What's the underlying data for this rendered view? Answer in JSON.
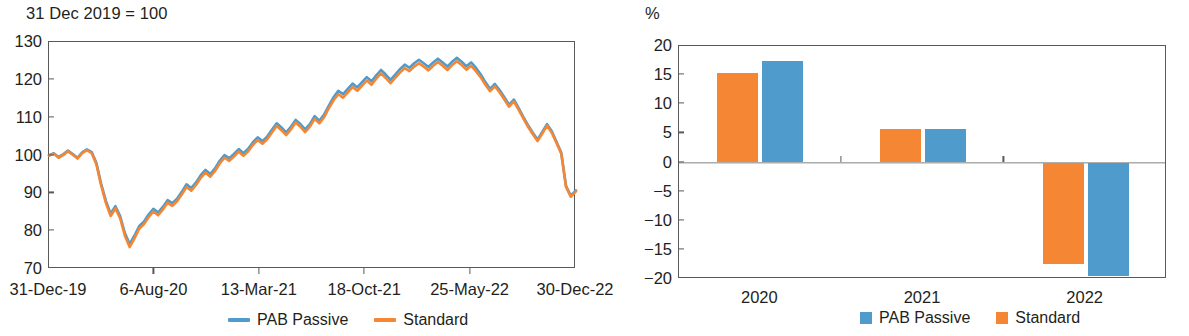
{
  "left": {
    "unit_label": "31 Dec 2019 = 100",
    "legend": [
      {
        "label": "PAB Passive",
        "color": "#4f9bcb",
        "marker": "line"
      },
      {
        "label": "Standard",
        "color": "#f58634",
        "marker": "line"
      }
    ]
  },
  "right": {
    "unit_label": "%",
    "legend": [
      {
        "label": "PAB Passive",
        "color": "#4f9bcb",
        "marker": "box"
      },
      {
        "label": "Standard",
        "color": "#f58634",
        "marker": "box"
      }
    ]
  },
  "chart_data": [
    {
      "type": "line",
      "title": "",
      "xlabel": "",
      "ylabel": "31 Dec 2019 = 100",
      "ylim": [
        70,
        130
      ],
      "yticks": [
        70,
        80,
        90,
        100,
        110,
        120,
        130
      ],
      "xticks": [
        "31-Dec-19",
        "6-Aug-20",
        "13-Mar-21",
        "18-Oct-21",
        "25-May-22",
        "30-Dec-22"
      ],
      "grid": false,
      "legend_position": "bottom",
      "x": [
        0,
        0.9,
        1.8,
        2.7,
        3.6,
        4.5,
        5.4,
        6.3,
        7.2,
        8.1,
        9.0,
        9.9,
        10.8,
        11.7,
        12.6,
        13.5,
        14.4,
        15.3,
        16.2,
        17.1,
        18.0,
        18.9,
        19.8,
        20.7,
        21.6,
        22.5,
        23.4,
        24.3,
        25.2,
        26.1,
        27.0,
        27.9,
        28.8,
        29.7,
        30.6,
        31.5,
        32.4,
        33.3,
        34.2,
        35.1,
        36.0,
        36.9,
        37.8,
        38.7,
        39.6,
        40.5,
        41.4,
        42.3,
        43.2,
        44.1,
        45.0,
        45.9,
        46.8,
        47.7,
        48.6,
        49.5,
        50.4,
        51.3,
        52.2,
        53.1,
        54.0,
        54.9,
        55.8,
        56.7,
        57.6,
        58.5,
        59.4,
        60.3,
        61.2,
        62.1,
        63.0,
        63.9,
        64.8,
        65.7,
        66.6,
        67.5,
        68.4,
        69.3,
        70.2,
        71.1,
        72.0,
        72.9,
        73.8,
        74.7,
        75.6,
        76.5,
        77.4,
        78.3,
        79.2,
        80.1,
        81.0,
        81.9,
        82.8,
        83.7,
        84.6,
        85.5,
        86.4,
        87.3,
        88.2,
        89.1,
        90.0,
        90.9,
        91.8,
        92.7,
        93.6,
        94.5,
        95.4,
        96.3,
        97.2,
        98.1,
        99.0,
        100
      ],
      "series": [
        {
          "name": "PAB Passive",
          "color": "#4f9bcb",
          "values": [
            100,
            100.6,
            99.6,
            100.3,
            101.3,
            100.4,
            99.4,
            100.8,
            101.6,
            100.9,
            98.0,
            92.5,
            88.0,
            84.6,
            86.6,
            84.0,
            79.5,
            76.6,
            78.8,
            81.3,
            82.5,
            84.4,
            85.9,
            84.9,
            86.4,
            88.2,
            87.4,
            88.6,
            90.4,
            92.4,
            91.4,
            92.9,
            94.8,
            96.2,
            95.1,
            96.6,
            98.6,
            100.1,
            99.3,
            100.4,
            101.7,
            100.6,
            101.8,
            103.5,
            104.8,
            103.8,
            105.0,
            106.8,
            108.5,
            107.4,
            106.1,
            107.6,
            109.4,
            108.3,
            106.9,
            108.3,
            110.4,
            109.2,
            110.8,
            113.2,
            115.4,
            117.1,
            116.2,
            117.6,
            119.0,
            118.0,
            119.4,
            120.7,
            119.6,
            121.2,
            122.6,
            121.4,
            120.0,
            121.4,
            122.8,
            124.0,
            123.2,
            124.4,
            125.3,
            124.4,
            123.4,
            124.6,
            125.6,
            124.6,
            123.5,
            124.8,
            125.8,
            124.8,
            123.6,
            124.6,
            123.2,
            121.5,
            119.4,
            117.6,
            118.9,
            117.3,
            115.4,
            113.4,
            114.8,
            112.6,
            110.2,
            108.0,
            106.0,
            104.2,
            106.2,
            108.3,
            106.4,
            103.6,
            100.8,
            92.0,
            89.4,
            90.8,
            95.8,
            99.6,
            101.4,
            101.0
          ]
        },
        {
          "name": "Standard",
          "color": "#f58634",
          "values": [
            100,
            100.5,
            99.4,
            100.1,
            101.1,
            100.2,
            99.2,
            100.6,
            101.4,
            100.6,
            97.6,
            92.0,
            87.4,
            84.0,
            86.0,
            83.4,
            78.8,
            75.8,
            78.0,
            80.6,
            81.8,
            83.7,
            85.2,
            84.2,
            85.7,
            87.5,
            86.7,
            87.9,
            89.7,
            91.7,
            90.7,
            92.2,
            94.1,
            95.5,
            94.4,
            95.9,
            97.9,
            99.4,
            98.6,
            99.7,
            101.0,
            99.9,
            101.1,
            102.8,
            104.1,
            103.1,
            104.3,
            106.1,
            107.8,
            106.7,
            105.4,
            106.9,
            108.7,
            107.6,
            106.2,
            107.6,
            109.7,
            108.5,
            110.1,
            112.5,
            114.6,
            116.2,
            115.3,
            116.7,
            118.1,
            117.1,
            118.5,
            119.8,
            118.7,
            120.3,
            121.7,
            120.5,
            119.1,
            120.5,
            121.9,
            123.1,
            122.3,
            123.5,
            124.4,
            123.5,
            122.5,
            123.7,
            124.7,
            123.7,
            122.6,
            123.9,
            124.9,
            123.9,
            122.7,
            123.7,
            122.3,
            120.7,
            118.7,
            117.0,
            118.3,
            116.7,
            114.8,
            112.9,
            114.3,
            112.1,
            109.8,
            107.6,
            105.6,
            103.8,
            105.8,
            107.9,
            106.0,
            103.3,
            100.5,
            91.7,
            89.1,
            90.5,
            95.5,
            99.3,
            101.1,
            100.7
          ]
        }
      ]
    },
    {
      "type": "bar",
      "title": "",
      "xlabel": "",
      "ylabel": "%",
      "ylim": [
        -20,
        20
      ],
      "yticks": [
        20,
        15,
        10,
        5,
        0,
        -5,
        -10,
        -15,
        -20
      ],
      "ytick_labels": [
        "20",
        "15",
        "10",
        "5",
        "0",
        "−5",
        "−10",
        "−15",
        "−20"
      ],
      "categories": [
        "2020",
        "2021",
        "2022"
      ],
      "grid": false,
      "legend_position": "bottom",
      "series": [
        {
          "name": "Standard",
          "color": "#f58634",
          "values": [
            15.4,
            5.7,
            -17.5
          ]
        },
        {
          "name": "PAB Passive",
          "color": "#4f9bcb",
          "values": [
            17.4,
            5.8,
            -19.4
          ]
        }
      ]
    }
  ]
}
